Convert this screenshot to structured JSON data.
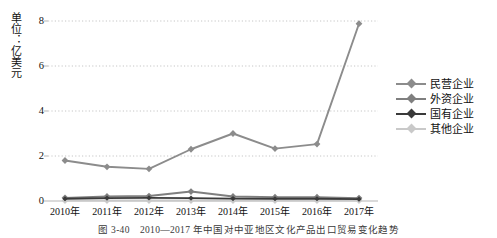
{
  "figure": {
    "caption": "图 3-40　2010—2017 年中国对中亚地区文化产品出口贸易变化趋势",
    "unit_label": "单位：亿美元"
  },
  "chart_data": {
    "type": "line",
    "title": "",
    "subtitle": "",
    "xlabel": "",
    "ylabel": "单位：亿美元",
    "categories": [
      "2010年",
      "2011年",
      "2012年",
      "2013年",
      "2014年",
      "2015年",
      "2016年",
      "2017年"
    ],
    "ylim": [
      0,
      8
    ],
    "yticks": [
      0,
      2,
      4,
      6,
      8
    ],
    "ytick_labels": [
      "0",
      "2",
      "4",
      "6",
      "8"
    ],
    "grid": true,
    "grid_style": "dotted-horizontal",
    "legend_position": "right",
    "series": [
      {
        "name": "民营企业",
        "color": "#8c8c8c",
        "marker": "diamond",
        "values": [
          1.8,
          1.52,
          1.43,
          2.3,
          3.0,
          2.33,
          2.53,
          7.88
        ]
      },
      {
        "name": "外资企业",
        "color": "#7f7f7f",
        "marker": "diamond",
        "values": [
          0.14,
          0.2,
          0.22,
          0.42,
          0.2,
          0.17,
          0.17,
          0.13
        ]
      },
      {
        "name": "国有企业",
        "color": "#3a3a3a",
        "marker": "diamond",
        "values": [
          0.1,
          0.13,
          0.14,
          0.13,
          0.11,
          0.1,
          0.1,
          0.08
        ]
      },
      {
        "name": "其他企业",
        "color": "#c9c9c9",
        "marker": "diamond",
        "values": [
          0.02,
          0.02,
          0.02,
          0.02,
          0.02,
          0.02,
          0.02,
          0.02
        ]
      }
    ]
  },
  "legend": {
    "items": [
      {
        "label": "民营企业",
        "color": "#8c8c8c"
      },
      {
        "label": "外资企业",
        "color": "#7f7f7f"
      },
      {
        "label": "国有企业",
        "color": "#3a3a3a"
      },
      {
        "label": "其他企业",
        "color": "#c9c9c9"
      }
    ]
  },
  "axes": {
    "y_tick_labels": [
      "8",
      "6",
      "4",
      "2",
      "0"
    ],
    "x_tick_labels": [
      "2010年",
      "2011年",
      "2012年",
      "2013年",
      "2014年",
      "2015年",
      "2016年",
      "2017年"
    ]
  },
  "colors": {
    "grid": "#c0c0c0",
    "axis": "#b5b5b5",
    "text": "#111111",
    "caption": "#3a3a3a"
  }
}
